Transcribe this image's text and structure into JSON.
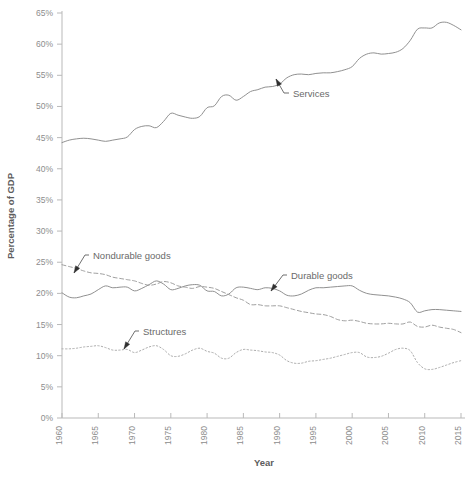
{
  "chart_data": {
    "type": "line",
    "title": "",
    "xlabel": "Year",
    "ylabel": "Percentage of GDP",
    "xlim": [
      1960,
      2015
    ],
    "ylim": [
      0,
      65
    ],
    "grid": false,
    "legend_position": "inline-annotations",
    "x_ticks": [
      1960,
      1965,
      1970,
      1975,
      1980,
      1985,
      1990,
      1995,
      2000,
      2005,
      2010,
      2015
    ],
    "x_tick_labels": [
      "1960",
      "1965",
      "1970",
      "1975",
      "1980",
      "1985",
      "1990",
      "1995",
      "2000",
      "2005",
      "2010",
      "2015"
    ],
    "y_ticks": [
      0,
      5,
      10,
      15,
      20,
      25,
      30,
      35,
      40,
      45,
      50,
      55,
      60,
      65
    ],
    "y_tick_labels": [
      "0%",
      "5%",
      "10%",
      "15%",
      "20%",
      "25%",
      "30%",
      "35%",
      "40%",
      "45%",
      "50%",
      "55%",
      "60%",
      "65%"
    ],
    "x": [
      1960,
      1961,
      1962,
      1963,
      1964,
      1965,
      1966,
      1967,
      1968,
      1969,
      1970,
      1971,
      1972,
      1973,
      1974,
      1975,
      1976,
      1977,
      1978,
      1979,
      1980,
      1981,
      1982,
      1983,
      1984,
      1985,
      1986,
      1987,
      1988,
      1989,
      1990,
      1991,
      1992,
      1993,
      1994,
      1995,
      1996,
      1997,
      1998,
      1999,
      2000,
      2001,
      2002,
      2003,
      2004,
      2005,
      2006,
      2007,
      2008,
      2009,
      2010,
      2011,
      2012,
      2013,
      2014,
      2015
    ],
    "series": [
      {
        "name": "Services",
        "style": "solid",
        "color": "#8a8a8a",
        "values": [
          44.2,
          44.6,
          44.8,
          44.9,
          44.8,
          44.6,
          44.4,
          44.6,
          44.8,
          45.1,
          46.3,
          46.8,
          46.9,
          46.6,
          47.6,
          48.9,
          48.6,
          48.3,
          48.1,
          48.4,
          49.8,
          50.1,
          51.6,
          51.8,
          51.0,
          51.6,
          52.4,
          52.7,
          53.1,
          53.2,
          53.6,
          54.6,
          55.1,
          55.2,
          55.1,
          55.3,
          55.4,
          55.4,
          55.6,
          55.9,
          56.4,
          57.7,
          58.4,
          58.6,
          58.4,
          58.5,
          58.7,
          59.3,
          60.6,
          62.4,
          62.6,
          62.6,
          63.4,
          63.5,
          63.0,
          62.3
        ]
      },
      {
        "name": "Durable goods",
        "style": "solid",
        "color": "#8a8a8a",
        "values": [
          20.1,
          19.4,
          19.3,
          19.6,
          19.9,
          20.6,
          21.2,
          20.9,
          21.0,
          21.0,
          20.4,
          20.8,
          21.4,
          22.0,
          21.5,
          20.6,
          20.8,
          21.2,
          21.4,
          21.3,
          20.4,
          20.3,
          19.6,
          19.9,
          20.9,
          21.0,
          20.8,
          20.6,
          20.9,
          20.8,
          20.4,
          19.7,
          19.6,
          19.9,
          20.5,
          20.9,
          20.9,
          21.0,
          21.1,
          21.2,
          21.2,
          20.5,
          20.0,
          19.8,
          19.7,
          19.6,
          19.4,
          19.1,
          18.5,
          17.0,
          17.2,
          17.4,
          17.4,
          17.3,
          17.2,
          17.1
        ]
      },
      {
        "name": "Nondurable goods",
        "style": "dashed",
        "color": "#9a9a9a",
        "values": [
          24.6,
          24.3,
          24.0,
          23.6,
          23.3,
          23.2,
          23.0,
          22.6,
          22.4,
          22.2,
          22.0,
          21.6,
          21.3,
          21.5,
          21.9,
          21.7,
          21.2,
          21.0,
          20.8,
          21.1,
          21.0,
          20.8,
          20.3,
          19.8,
          19.3,
          18.9,
          18.2,
          18.2,
          18.0,
          18.0,
          18.0,
          17.7,
          17.4,
          17.1,
          16.9,
          16.7,
          16.6,
          16.3,
          15.8,
          15.6,
          15.7,
          15.5,
          15.2,
          15.1,
          15.1,
          15.2,
          15.1,
          15.1,
          15.4,
          14.7,
          14.6,
          14.9,
          14.6,
          14.4,
          14.2,
          13.7
        ]
      },
      {
        "name": "Structures",
        "style": "dotted",
        "color": "#a6a6a6",
        "values": [
          11.1,
          11.1,
          11.2,
          11.4,
          11.5,
          11.6,
          11.3,
          10.9,
          10.9,
          11.0,
          10.5,
          10.9,
          11.4,
          11.6,
          11.0,
          10.0,
          9.9,
          10.3,
          10.9,
          11.2,
          10.7,
          10.4,
          9.6,
          9.6,
          10.5,
          11.0,
          10.9,
          10.8,
          10.6,
          10.5,
          10.1,
          9.2,
          8.8,
          8.8,
          9.1,
          9.2,
          9.4,
          9.6,
          9.9,
          10.2,
          10.5,
          10.5,
          9.8,
          9.7,
          9.9,
          10.4,
          11.0,
          11.2,
          10.8,
          8.9,
          7.9,
          7.8,
          8.1,
          8.5,
          8.9,
          9.2
        ]
      }
    ],
    "annotations": [
      {
        "label": "Services",
        "series": "Services",
        "label_x": 293,
        "label_y": 97,
        "arrow_tip_x": 276,
        "arrow_tip_y": 79,
        "elbow_x": 284,
        "elbow_y": 93
      },
      {
        "label": "Nondurable goods",
        "series": "Nondurable goods",
        "label_x": 93,
        "label_y": 259,
        "arrow_tip_x": 74,
        "arrow_tip_y": 273,
        "elbow_x": 85,
        "elbow_y": 255
      },
      {
        "label": "Durable goods",
        "series": "Durable goods",
        "label_x": 291,
        "label_y": 279,
        "arrow_tip_x": 271,
        "arrow_tip_y": 291,
        "elbow_x": 283,
        "elbow_y": 275
      },
      {
        "label": "Structures",
        "series": "Structures",
        "label_x": 143,
        "label_y": 335,
        "arrow_tip_x": 124,
        "arrow_tip_y": 349,
        "elbow_x": 135,
        "elbow_y": 331
      }
    ]
  },
  "axes": {
    "x_title": "Year",
    "y_title": "Percentage of GDP"
  },
  "colors": {
    "axis": "#b9b9b9",
    "tick_text": "#8d8d8d",
    "title_text": "#5d5d5d",
    "series_line": "#8a8a8a",
    "annotation_leader": "#4a4a4a",
    "background": "#ffffff"
  }
}
